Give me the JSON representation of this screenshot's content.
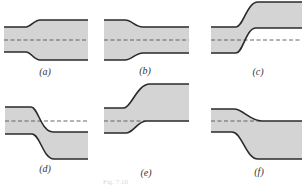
{
  "figure": {
    "caption": "Fig. 7.10",
    "colors": {
      "fill": "#d4d4d4",
      "wall": "#2a2a2a",
      "centerline": "#555555",
      "label": "#333333"
    },
    "panels": [
      {
        "id": "a",
        "label": "(a)",
        "description": "symmetric expansion (narrow to wide)",
        "top_path": "M4,27 L26,27 C31,27 34,20 40,20 L88,20",
        "bottom_path": "M4,52 L26,52 C31,52 34,60 40,60 L88,60",
        "fill_path": "M4,27 L26,27 C31,27 34,20 40,20 L88,20 L88,60 L40,60 C34,60 31,52 26,52 L4,52 Z",
        "centerline": {
          "x1": 4,
          "x2": 88,
          "y": 40
        },
        "label_pos": {
          "x": 45,
          "y": 66
        }
      },
      {
        "id": "b",
        "label": "(b)",
        "description": "symmetric contraction (wide to narrow)",
        "top_path": "M104,20 L125,20 C132,20 135,27 143,27 L189,27",
        "bottom_path": "M104,60 L125,60 C132,60 135,53 143,53 L189,53",
        "fill_path": "M104,20 L125,20 C132,20 135,27 143,27 L189,27 L189,53 L143,53 C135,53 132,60 125,60 L104,60 Z",
        "centerline": {
          "x1": 104,
          "x2": 189,
          "y": 40
        },
        "label_pos": {
          "x": 145,
          "y": 65
        }
      },
      {
        "id": "c",
        "label": "(c)",
        "description": "offset upward step, centerline unchanged",
        "top_path": "M211,27 L236,27 C243,27 247,2 258,2 L302,2",
        "bottom_path": "M211,53 L236,53 C243,53 246,28 256,28 L302,28",
        "fill_path": "M211,27 L236,27 C243,27 247,2 258,2 L302,2 L302,28 L256,28 C246,28 243,53 236,53 L211,53 Z",
        "centerline": {
          "x1": 211,
          "x2": 302,
          "y": 40
        },
        "label_pos": {
          "x": 258,
          "y": 66
        }
      },
      {
        "id": "d",
        "label": "(d)",
        "description": "offset downward step, centerline unchanged",
        "top_path": "M5,107 L31,107 C38,107 41,132 53,132 L88,132",
        "bottom_path": "M5,134 L32,134 C40,134 43,159 54,159 L88,159",
        "fill_path": "M5,107 L31,107 C38,107 41,132 53,132 L88,132 L88,159 L54,159 C43,159 40,134 32,134 L5,134 Z",
        "centerline": {
          "x1": 5,
          "x2": 88,
          "y": 121
        },
        "label_pos": {
          "x": 45,
          "y": 163
        }
      },
      {
        "id": "e",
        "label": "(e)",
        "description": "asymmetric upward expansion",
        "top_path": "M104,108 L124,108 C131,108 137,84 150,84 L189,84",
        "bottom_path": "M104,133 L126,133 C133,133 138,121 146,121 L189,121",
        "fill_path": "M104,108 L124,108 C131,108 137,84 150,84 L189,84 L189,121 L146,121 C138,121 133,133 126,133 L104,133 Z",
        "centerline": {
          "x1": 104,
          "x2": 146,
          "y": 121
        },
        "label_pos": {
          "x": 146,
          "y": 167
        }
      },
      {
        "id": "f",
        "label": "(f)",
        "description": "asymmetric expansion downward",
        "top_path": "M211,109 L234,109 C243,109 250,121 262,121 L302,121",
        "bottom_path": "M211,132 L232,132 C242,132 246,159 258,159 L302,159",
        "fill_path": "M211,109 L234,109 C243,109 250,121 262,121 L302,121 L302,159 L258,159 C246,159 242,132 232,132 L211,132 Z",
        "centerline": {
          "x1": 211,
          "x2": 262,
          "y": 121
        },
        "label_pos": {
          "x": 259,
          "y": 166
        }
      }
    ]
  }
}
